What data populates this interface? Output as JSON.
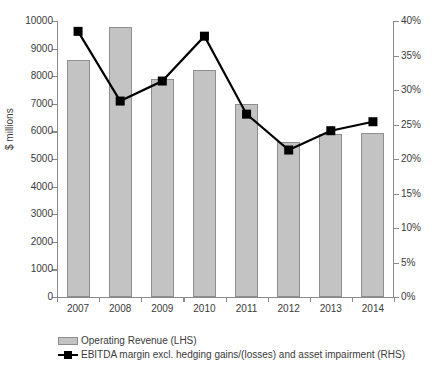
{
  "chart_data": {
    "type": "bar",
    "title": "",
    "subtitle": "",
    "xlabel": "",
    "ylabel": "$ millions",
    "y2label": "",
    "categories": [
      "2007",
      "2008",
      "2009",
      "2010",
      "2011",
      "2012",
      "2013",
      "2014"
    ],
    "ylim": [
      0,
      10000
    ],
    "y2lim": [
      0,
      40
    ],
    "grid": false,
    "legend_position": "bottom-left",
    "y_ticks": [
      "0",
      "1000",
      "2000",
      "3000",
      "4000",
      "5000",
      "6000",
      "7000",
      "8000",
      "9000",
      "10000"
    ],
    "y_tick_values": [
      0,
      1000,
      2000,
      3000,
      4000,
      5000,
      6000,
      7000,
      8000,
      9000,
      10000
    ],
    "y2_ticks": [
      "0%",
      "5%",
      "10%",
      "15%",
      "20%",
      "25%",
      "30%",
      "35%",
      "40%"
    ],
    "y2_tick_values": [
      0,
      5,
      10,
      15,
      20,
      25,
      30,
      35,
      40
    ],
    "series": [
      {
        "name": "Operating Revenue (LHS)",
        "type": "bar",
        "axis": "left",
        "color": "#c3c3c3",
        "edge_color": "#8e8e8e",
        "values": [
          8570,
          9800,
          7900,
          8220,
          7000,
          5600,
          5900,
          5950
        ]
      },
      {
        "name": "EBITDA margin excl. hedging gains/(losses) and asset impairment (RHS)",
        "type": "line",
        "axis": "right",
        "color": "#000000",
        "marker": "square",
        "values": [
          38.5,
          28.4,
          31.3,
          37.8,
          26.5,
          21.3,
          24.1,
          25.4
        ]
      }
    ]
  },
  "legend": {
    "items": [
      {
        "label": "Operating Revenue (LHS)",
        "swatch": "bar-swatch"
      },
      {
        "label": "EBITDA margin excl. hedging gains/(losses) and asset impairment (RHS)",
        "swatch": "line-marker-swatch"
      }
    ]
  }
}
